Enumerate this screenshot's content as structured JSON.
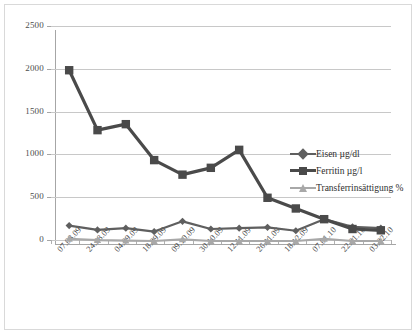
{
  "chart_data": {
    "type": "line",
    "title": "",
    "xlabel": "",
    "ylabel": "",
    "ylim": [
      0,
      2500
    ],
    "ytick_values": [
      0,
      500,
      1000,
      1500,
      2000,
      2500
    ],
    "ytick_labels": [
      "0",
      "500",
      "1000",
      "1500",
      "2000",
      "2500"
    ],
    "grid": true,
    "legend_position": "center right",
    "categories": [
      "07.08.09",
      "24.08.09",
      "04.09.09",
      "18.09.09",
      "09.10.09",
      "30.10.09",
      "12.11.09",
      "26.11.09",
      "18.12.09",
      "07.01.10",
      "22.01.10",
      "03.02.10"
    ],
    "series": [
      {
        "name": "Eisen µg/dl",
        "color": "#5f5f5f",
        "marker": "diamond",
        "values": [
          215,
          165,
          185,
          145,
          265,
          175,
          185,
          195,
          155,
          290,
          200,
          185
        ]
      },
      {
        "name": "Ferritin µg/l",
        "color": "#4a4a4a",
        "marker": "square",
        "values": [
          2030,
          1330,
          1400,
          980,
          810,
          890,
          1100,
          540,
          415,
          290,
          175,
          160
        ]
      },
      {
        "name": "Transferrinsättigung %",
        "color": "#a8a8a8",
        "marker": "triangle",
        "values": [
          60,
          45,
          40,
          35,
          55,
          35,
          35,
          35,
          35,
          60,
          35,
          35
        ]
      }
    ]
  },
  "legend": {
    "items": [
      {
        "label": "Eisen µg/dl"
      },
      {
        "label": "Ferritin µg/l"
      },
      {
        "label": "Transferrinsättigung %"
      }
    ]
  },
  "colors": {
    "series_eisen": "#5f5f5f",
    "series_ferritin": "#4a4a4a",
    "series_transferrin": "#a8a8a8",
    "gridline": "#c8c8c8",
    "axis": "#a6a6a6",
    "background": "#ffffff",
    "frame_border": "#d9d9d9"
  }
}
